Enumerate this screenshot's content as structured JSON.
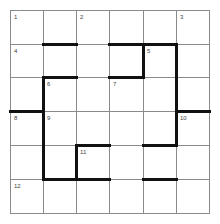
{
  "puzzle": {
    "rows": 6,
    "cols": 6,
    "col_lines": [
      10,
      43,
      76,
      109,
      143,
      176,
      209
    ],
    "row_lines": [
      10,
      44,
      77,
      111,
      145,
      179,
      213
    ],
    "numbers": [
      {
        "label": "1",
        "row": 0,
        "col": 0
      },
      {
        "label": "2",
        "row": 0,
        "col": 2
      },
      {
        "label": "3",
        "row": 0,
        "col": 5
      },
      {
        "label": "4",
        "row": 1,
        "col": 0
      },
      {
        "label": "5",
        "row": 1,
        "col": 4
      },
      {
        "label": "6",
        "row": 2,
        "col": 1
      },
      {
        "label": "7",
        "row": 2,
        "col": 3
      },
      {
        "label": "8",
        "row": 3,
        "col": 0
      },
      {
        "label": "9",
        "row": 3,
        "col": 1
      },
      {
        "label": "10",
        "row": 3,
        "col": 5
      },
      {
        "label": "11",
        "row": 4,
        "col": 2
      },
      {
        "label": "12",
        "row": 5,
        "col": 0
      }
    ],
    "thick_h": [
      {
        "row_line": 1,
        "from_col": 1,
        "to_col": 2
      },
      {
        "row_line": 1,
        "from_col": 3,
        "to_col": 5
      },
      {
        "row_line": 2,
        "from_col": 3,
        "to_col": 4
      },
      {
        "row_line": 2,
        "from_col": 1,
        "to_col": 2
      },
      {
        "row_line": 3,
        "from_col": 0,
        "to_col": 1
      },
      {
        "row_line": 3,
        "from_col": 5,
        "to_col": 6
      },
      {
        "row_line": 4,
        "from_col": 4,
        "to_col": 5
      },
      {
        "row_line": 4,
        "from_col": 2,
        "to_col": 3
      },
      {
        "row_line": 5,
        "from_col": 1,
        "to_col": 3
      },
      {
        "row_line": 5,
        "from_col": 4,
        "to_col": 5
      }
    ],
    "thick_v": [
      {
        "col_line": 4,
        "from_row": 1,
        "to_row": 2
      },
      {
        "col_line": 5,
        "from_row": 1,
        "to_row": 4
      },
      {
        "col_line": 1,
        "from_row": 2,
        "to_row": 5
      },
      {
        "col_line": 2,
        "from_row": 4,
        "to_row": 5
      }
    ],
    "colors": {
      "thin": "#8a8a8a",
      "thick": "#111111",
      "background": "#ffffff",
      "number": "#444444"
    }
  }
}
